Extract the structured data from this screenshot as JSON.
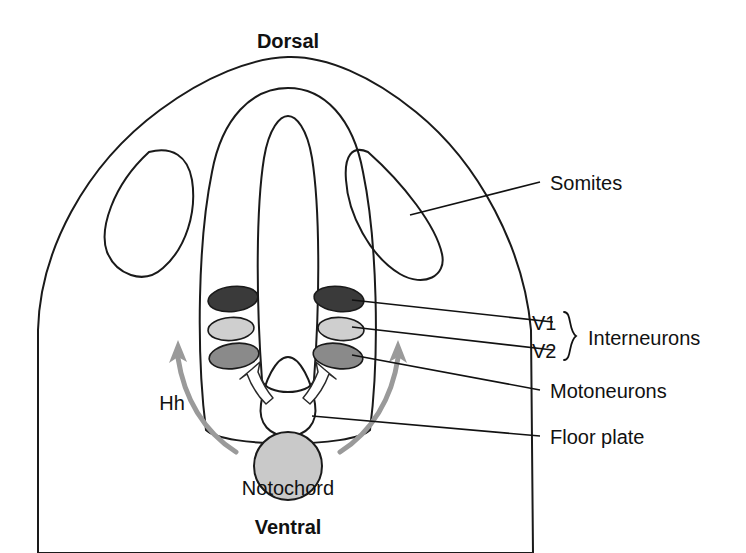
{
  "figure": {
    "title_top": "Dorsal",
    "title_bottom": "Ventral"
  },
  "axis_labels": {
    "dorsal": "Dorsal",
    "ventral": "Ventral"
  },
  "labels": {
    "somites": "Somites",
    "v1": "V1",
    "v2": "V2",
    "interneurons": "Interneurons",
    "motoneurons": "Motoneurons",
    "floor_plate": "Floor plate",
    "notochord": "Notochord",
    "hh": "Hh"
  },
  "structures": [
    {
      "name": "body",
      "label": "",
      "fill": "#e9e9e9",
      "stroke": "#1a1a1a"
    },
    {
      "name": "somite-left",
      "label": "Somites",
      "fill": "#c4c4c4",
      "stroke": "#1a1a1a"
    },
    {
      "name": "somite-right",
      "label": "Somites",
      "fill": "#c4c4c4",
      "stroke": "#1a1a1a"
    },
    {
      "name": "neural-tube",
      "label": "",
      "fill": "#e9e9e9",
      "stroke": "#1a1a1a"
    },
    {
      "name": "neural-canal",
      "label": "",
      "fill": "#ffffff",
      "stroke": "#1a1a1a"
    },
    {
      "name": "floor-plate",
      "label": "Floor plate",
      "fill": "#c9c9c9",
      "stroke": "#1a1a1a"
    },
    {
      "name": "notochord",
      "label": "Notochord",
      "fill": "#c9c9c9",
      "stroke": "#1a1a1a"
    }
  ],
  "neuron_groups": [
    {
      "name": "v1",
      "label": "V1",
      "fill": "#3a3a3a",
      "stroke": "#1a1a1a"
    },
    {
      "name": "v2",
      "label": "V2",
      "fill": "#cfcfcf",
      "stroke": "#1a1a1a"
    },
    {
      "name": "motoneurons",
      "label": "Motoneurons",
      "fill": "#8a8a8a",
      "stroke": "#1a1a1a"
    }
  ],
  "signals": [
    {
      "name": "hh-long-range-arrow",
      "label": "Hh",
      "color": "#9a9a9a"
    },
    {
      "name": "floor-plate-arrow-left",
      "label": "",
      "color": "#ffffff"
    },
    {
      "name": "floor-plate-arrow-right",
      "label": "",
      "color": "#ffffff"
    }
  ],
  "brace": {
    "name": "interneurons-brace",
    "groups": [
      "V1",
      "V2"
    ],
    "label": "Interneurons"
  },
  "colors": {
    "background": "#ffffff",
    "body_fill": "#e9e9e9",
    "somite_fill": "#c4c4c4",
    "outline": "#1a1a1a",
    "v1_fill": "#3a3a3a",
    "v2_fill": "#cfcfcf",
    "moto_fill": "#8a8a8a",
    "text": "#111111",
    "hh_arrow": "#9a9a9a"
  }
}
